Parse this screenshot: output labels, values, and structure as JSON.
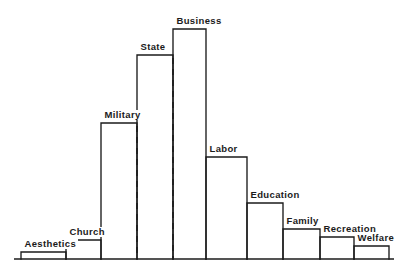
{
  "chart_data": {
    "type": "bar",
    "title": "",
    "subtitle": "",
    "xlabel": "",
    "ylabel": "",
    "grid": false,
    "legend": "none",
    "orientation": "vertical",
    "value_unit": "relative power (arbitrary units)",
    "ylim": [
      0,
      100
    ],
    "categories": [
      "Aesthetics",
      "Church",
      "Military",
      "State",
      "Business",
      "Labor",
      "Education",
      "Family",
      "Recreation",
      "Welfare"
    ],
    "values": [
      3,
      9,
      66,
      100,
      115,
      53,
      31,
      19,
      14,
      10
    ],
    "bars": [
      {
        "label": "Aesthetics",
        "value": 3,
        "x0": 21,
        "x1": 66,
        "top": 252
      },
      {
        "label": "Church",
        "value": 9,
        "x0": 66,
        "x1": 101,
        "top": 240
      },
      {
        "label": "Military",
        "value": 66,
        "x0": 101,
        "x1": 137,
        "top": 123
      },
      {
        "label": "State",
        "value": 100,
        "x0": 137,
        "x1": 173,
        "top": 55
      },
      {
        "label": "Business",
        "value": 115,
        "x0": 173,
        "x1": 206,
        "top": 29
      },
      {
        "label": "Labor",
        "value": 53,
        "x0": 206,
        "x1": 247,
        "top": 157
      },
      {
        "label": "Education",
        "value": 31,
        "x0": 247,
        "x1": 283,
        "top": 203
      },
      {
        "label": "Family",
        "value": 19,
        "x0": 283,
        "x1": 320,
        "top": 229
      },
      {
        "label": "Recreation",
        "value": 14,
        "x0": 320,
        "x1": 354,
        "top": 237
      },
      {
        "label": "Welfare",
        "value": 10,
        "x0": 354,
        "x1": 389,
        "top": 246
      }
    ],
    "annotations": [
      {
        "name": "divider-left",
        "type": "dashed-vertical-line",
        "x": 137,
        "y_top": 126,
        "y_bottom": 259
      },
      {
        "name": "divider-right",
        "type": "dashed-vertical-line",
        "x": 173,
        "y_top": 58,
        "y_bottom": 259
      }
    ],
    "axis": {
      "baseline_y": 259,
      "baseline_x_start": 14,
      "baseline_x_end": 394,
      "tick_labels": [],
      "axis_color": "#1b1b1b"
    }
  },
  "colors": {
    "background": "#ffffff",
    "ink": "#1b1b1b"
  }
}
